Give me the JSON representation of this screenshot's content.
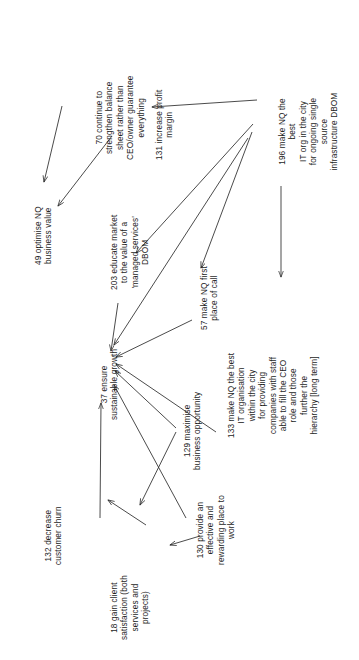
{
  "diagram": {
    "orientation": "rotated-90-ccw",
    "background_color": "#ffffff",
    "line_color": "#2a2a2a",
    "text_color": "#1d1d1d",
    "nodes": [
      {
        "id": "70",
        "code": "70",
        "label": "70 continue to\nstrengthen balance\nsheet rather than\nCEO/owner guarantee\neverything",
        "x": 95,
        "y": 160
      },
      {
        "id": "131",
        "code": "131",
        "label": "131 increase profit\nmargin",
        "x": 155,
        "y": 160
      },
      {
        "id": "196",
        "code": "196",
        "label": "196 make NQ the best\nIT org in the city\nfor ongoing single\nsource\ninfrastructure DBOM",
        "x": 278,
        "y": 172
      },
      {
        "id": "49",
        "code": "49",
        "label": "49 optimise NQ\nbusiness value",
        "x": 34,
        "y": 265
      },
      {
        "id": "203",
        "code": "203",
        "label": "203 educate market\nto the value of a\n'managed services'\nDBOM",
        "x": 110,
        "y": 290
      },
      {
        "id": "57",
        "code": "57",
        "label": "57 make NQ first\nplace of call",
        "x": 200,
        "y": 330
      },
      {
        "id": "37",
        "code": "37",
        "label": "37 ensure\nsustainable growth",
        "x": 100,
        "y": 420
      },
      {
        "id": "133",
        "code": "133",
        "label": "133 make NQ the best\nIT organisation\nwithin the city\nfor providing\ncompanies with staff\nable to fill the CEO\nrole and those\nfurther the\nhierarchy [long term]",
        "x": 227,
        "y": 438
      },
      {
        "id": "129",
        "code": "129",
        "label": "129 maximise\nbusiness opportunity",
        "x": 183,
        "y": 470
      },
      {
        "id": "130",
        "code": "130",
        "label": "130 provide an\neffective and\nrewarding place to\nwork",
        "x": 196,
        "y": 565
      },
      {
        "id": "132",
        "code": "132",
        "label": "132 decrease\ncustomer churn",
        "x": 44,
        "y": 565
      },
      {
        "id": "18",
        "code": "18",
        "label": "18 gain client\nsatisfaction (both\nservices and\nprojects)",
        "x": 110,
        "y": 640
      }
    ],
    "edges": [
      {
        "from": "70",
        "to": "49",
        "path": "M 62 106 L 44 182"
      },
      {
        "from": "196",
        "to": "131",
        "path": "M 257 100 L 152 107"
      },
      {
        "from": "203",
        "to": "49",
        "path": "M 112 136 L 58 206"
      },
      {
        "from": "196",
        "to": "203",
        "path": "M 253 124 L 136 253"
      },
      {
        "from": "196",
        "to": "133",
        "path": "M 281 186 L 281 277"
      },
      {
        "from": "196",
        "to": "57",
        "path": "M 252 132 L 201 268"
      },
      {
        "from": "196",
        "to": "37",
        "path": "M 248 138 L 114 345"
      },
      {
        "from": "203",
        "to": "37",
        "path": "M 118 303 L 111 351"
      },
      {
        "from": "57",
        "to": "37",
        "path": "M 192 320 L 116 357"
      },
      {
        "from": "129",
        "to": "37",
        "path": "M 176 428 L 115 371"
      },
      {
        "from": "133",
        "to": "37",
        "path": "M 216 432 L 116 364"
      },
      {
        "from": "130",
        "to": "37",
        "path": "M 186 518 L 114 385"
      },
      {
        "from": "132",
        "to": "37",
        "path": "M 100 518 L 101 403"
      },
      {
        "from": "18",
        "to": "132",
        "path": "M 146 525 L 108 500"
      },
      {
        "from": "130",
        "to": "18",
        "path": "M 200 536 L 170 545"
      },
      {
        "from": "129",
        "to": "18",
        "path": "M 176 432 L 140 505"
      }
    ]
  }
}
